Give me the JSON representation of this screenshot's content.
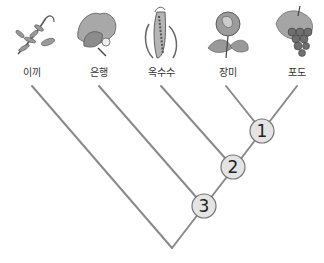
{
  "diagram": {
    "type": "cladogram",
    "taxa": [
      {
        "label": "이끼",
        "icon": "moss-icon",
        "x": 32
      },
      {
        "label": "은행",
        "icon": "ginkgo-icon",
        "x": 99
      },
      {
        "label": "옥수수",
        "icon": "corn-icon",
        "x": 161
      },
      {
        "label": "장미",
        "icon": "rose-icon",
        "x": 228
      },
      {
        "label": "포도",
        "icon": "grape-icon",
        "x": 297
      }
    ],
    "nodes": [
      {
        "label": "1",
        "x": 262,
        "y": 131
      },
      {
        "label": "2",
        "x": 233,
        "y": 167
      },
      {
        "label": "3",
        "x": 204,
        "y": 206
      }
    ],
    "colors": {
      "branch": "#8a8a8a",
      "node_fill": "#e4e4e4",
      "node_stroke": "#777777"
    }
  }
}
